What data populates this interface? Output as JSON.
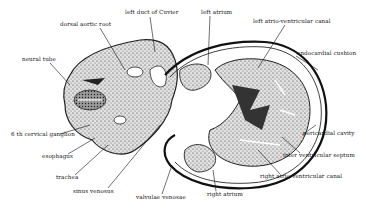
{
  "figure": {
    "labels": [
      {
        "id": "dorsal-aortic-root",
        "text": "dorsal aortic root",
        "x": 60,
        "y": 25
      },
      {
        "id": "left-duct-of-cuvier",
        "text": "left duct of Cuvier",
        "x": 125,
        "y": 13
      },
      {
        "id": "left-atrium",
        "text": "left atrium",
        "x": 201,
        "y": 12
      },
      {
        "id": "left-atrio-ventricular-canal",
        "text": "left atrio-ventricular canal",
        "x": 253,
        "y": 21
      },
      {
        "id": "neural-tube",
        "text": "neural tube",
        "x": 22,
        "y": 59
      },
      {
        "id": "endocardial-cushion",
        "text": "endocardial cushion",
        "x": 297,
        "y": 53
      },
      {
        "id": "6th-cervical-ganglion",
        "text": "6 th cervical ganglion",
        "x": 11,
        "y": 134
      },
      {
        "id": "esophagus",
        "text": "esophagus",
        "x": 42,
        "y": 156
      },
      {
        "id": "trachea",
        "text": "trachea",
        "x": 56,
        "y": 177
      },
      {
        "id": "sinus-venosus",
        "text": "sinus venosus",
        "x": 73,
        "y": 191
      },
      {
        "id": "valvulae-venosae",
        "text": "valvulae venosae",
        "x": 136,
        "y": 197
      },
      {
        "id": "right-atrium",
        "text": "right atrium",
        "x": 207,
        "y": 194
      },
      {
        "id": "pericardial-cavity",
        "text": "pericardial cavity",
        "x": 303,
        "y": 133
      },
      {
        "id": "inter-ventricular-septum",
        "text": "inter ventricular septum",
        "x": 283,
        "y": 155
      },
      {
        "id": "right-atrio-ventricular-canal",
        "text": "right atrio-ventricular canal",
        "x": 260,
        "y": 176
      }
    ]
  }
}
